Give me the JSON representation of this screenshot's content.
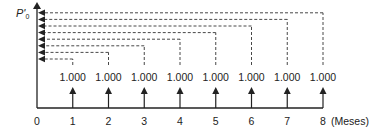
{
  "diagram": {
    "type": "cash-flow-timeline",
    "y_axis_label": "P'",
    "y_axis_subscript": "0",
    "x_axis_unit": "(Meses)",
    "origin_label": "0",
    "periods": [
      {
        "t": "1",
        "amount": "1.000"
      },
      {
        "t": "2",
        "amount": "1.000"
      },
      {
        "t": "3",
        "amount": "1.000"
      },
      {
        "t": "4",
        "amount": "1.000"
      },
      {
        "t": "5",
        "amount": "1.000"
      },
      {
        "t": "6",
        "amount": "1.000"
      },
      {
        "t": "7",
        "amount": "1.000"
      },
      {
        "t": "8",
        "amount": "1.000"
      }
    ],
    "colors": {
      "line": "#222222",
      "dashed": "#333333",
      "text": "#222222"
    }
  }
}
